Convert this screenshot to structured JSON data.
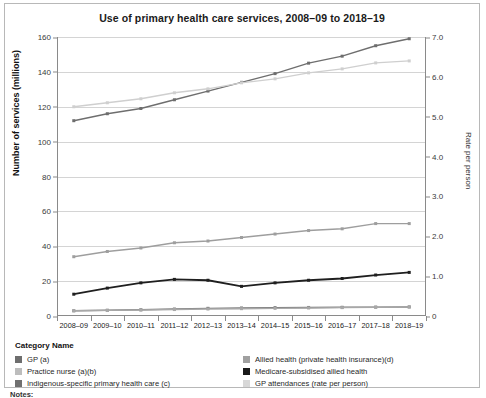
{
  "chart_data": {
    "type": "line",
    "title": "Use of primary health care services, 2008–09 to 2018–19",
    "xlabel": "",
    "ylabel": "Number of services (millions)",
    "y2label": "Rate per person",
    "ylim": [
      0,
      160
    ],
    "y2lim": [
      0,
      7.0
    ],
    "yticks": [
      "0",
      "20",
      "40",
      "60",
      "80",
      "100",
      "120",
      "140",
      "160"
    ],
    "y2ticks": [
      "0",
      "1.0",
      "2.0",
      "3.0",
      "4.0",
      "5.0",
      "6.0",
      "7.0"
    ],
    "grid": true,
    "legend_position": "below",
    "legend_title": "Category Name",
    "categories": [
      "2008–09",
      "2009–10",
      "2010–11",
      "2011–12",
      "2012–13",
      "2013–14",
      "2014–15",
      "2015–16",
      "2016–17",
      "2017–18",
      "2018–19"
    ],
    "series": [
      {
        "name": "GP (a)",
        "axis": "left",
        "color": "#6e6e6e",
        "values": [
          112,
          116,
          119,
          124,
          129,
          134,
          139,
          145,
          149,
          155,
          159
        ]
      },
      {
        "name": "Practice nurse (a)(b)",
        "axis": "left",
        "color": "#9e9e9e",
        "values": [
          34,
          37,
          39,
          42,
          43,
          45,
          47,
          49,
          50,
          53,
          53
        ]
      },
      {
        "name": "Indigenous-specific primary health care (c)",
        "axis": "left",
        "color": "#7a7a7a",
        "values": [
          3.0,
          3.3,
          3.6,
          4.0,
          4.4,
          4.6,
          4.8,
          4.9,
          5.0,
          5.1,
          5.2
        ]
      },
      {
        "name": "Allied health (private health insurance)(d)",
        "axis": "left",
        "color": "#a8a8a8",
        "values": [
          3.0,
          3.2,
          3.4,
          3.7,
          4.0,
          4.2,
          4.4,
          4.6,
          4.8,
          5.0,
          5.2
        ]
      },
      {
        "name": "Medicare-subsidised allied health",
        "axis": "left",
        "color": "#1f1f1f",
        "values": [
          12.5,
          16,
          19,
          21,
          20.5,
          17,
          19,
          20.5,
          21.5,
          23.5,
          25
        ]
      },
      {
        "name": "GP attendances (rate per person)",
        "axis": "right",
        "color": "#cfcfcf",
        "values": [
          5.25,
          5.35,
          5.45,
          5.6,
          5.7,
          5.85,
          5.95,
          6.1,
          6.2,
          6.35,
          6.4
        ]
      }
    ]
  },
  "legend": {
    "title": "Category Name",
    "left_column": [
      {
        "label": "GP (a)",
        "color": "#6e6e6e"
      },
      {
        "label": "Practice nurse (a)(b)",
        "color": "#bdbdbd"
      },
      {
        "label": "Indigenous-specific primary health care (c)",
        "color": "#707070"
      }
    ],
    "right_column": [
      {
        "label": "Allied health (private health insurance)(d)",
        "color": "#a0a0a0"
      },
      {
        "label": "Medicare-subsidised allied health",
        "color": "#1a1a1a"
      },
      {
        "label": "GP attendances (rate per person)",
        "color": "#d8d8d8"
      }
    ]
  },
  "footer": {
    "notes_label": "Notes:"
  }
}
